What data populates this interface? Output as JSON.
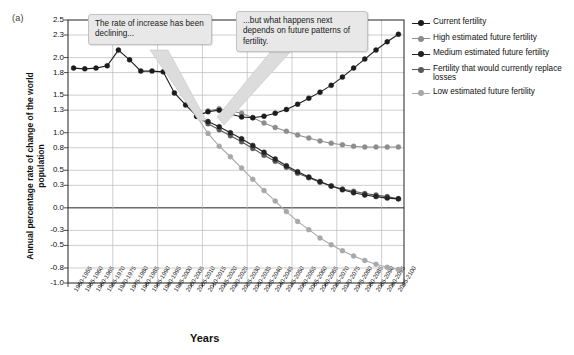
{
  "figure": {
    "panel_label": "(a)",
    "x_axis_title": "Years",
    "y_axis_title": "Annual percentage rate of change of the world population"
  },
  "callouts": [
    {
      "id": "callout-rate-decline",
      "text": "The rate of increase has been declining..."
    },
    {
      "id": "callout-future-patterns",
      "text": "...but what happens next depends on future patterns of fertility."
    }
  ],
  "legend": {
    "position": "right",
    "items": [
      {
        "label": "Current fertility",
        "color": "#1c1c1c"
      },
      {
        "label": "High estimated future fertility",
        "color": "#8d8d8d"
      },
      {
        "label": "Medium estimated future fertility",
        "color": "#232323"
      },
      {
        "label": "Fertility that would currently replace losses",
        "color": "#5a5a5a"
      },
      {
        "label": "Low estimated future fertility",
        "color": "#a8a8a8"
      }
    ]
  },
  "chart_data": {
    "type": "line",
    "title": "",
    "subtitle": "",
    "xlabel": "Years",
    "ylabel": "Annual percentage rate of change of the world population",
    "grid": true,
    "legend_position": "right",
    "ylim": [
      -1.0,
      2.5
    ],
    "ytick_labels": [
      "2.5",
      "2.3",
      "2.0",
      "1.8",
      "1.5",
      "1.3",
      "1.0",
      "0.8",
      "0.5",
      "0.3",
      "0.0",
      "-0.3",
      "-0.5",
      "-0.8",
      "-1.0"
    ],
    "ytick_values": [
      2.5,
      2.3,
      2.0,
      1.8,
      1.5,
      1.3,
      1.0,
      0.8,
      0.5,
      0.3,
      0.0,
      -0.3,
      -0.5,
      -0.8,
      -1.0
    ],
    "categories": [
      "1950-1955",
      "1955-1960",
      "1960-1965",
      "1965-1970",
      "1970-1975",
      "1975-1980",
      "1980-1985",
      "1985-1990",
      "1990-1995",
      "1995-2000",
      "2000-2005",
      "2005-2010",
      "2010-2015",
      "2015-2020",
      "2020-2025",
      "2025-2030",
      "2030-2035",
      "2035-2040",
      "2040-2045",
      "2045-2050",
      "2050-2055",
      "2055-2060",
      "2060-2065",
      "2065-2070",
      "2070-2075",
      "2075-2080",
      "2080-2085",
      "2085-2090",
      "2090-2095",
      "2095-2100"
    ],
    "projection_start_category": "2005-2010",
    "series": [
      {
        "name": "Current fertility",
        "color": "#1c1c1c",
        "values": [
          1.86,
          1.85,
          1.86,
          1.89,
          2.1,
          1.97,
          1.82,
          1.82,
          1.81,
          1.53,
          1.37,
          1.22,
          1.28,
          1.3,
          1.25,
          1.21,
          1.2,
          1.22,
          1.26,
          1.31,
          1.38,
          1.46,
          1.54,
          1.63,
          1.74,
          1.86,
          1.98,
          2.1,
          2.21,
          2.31
        ]
      },
      {
        "name": "High estimated future fertility",
        "color": "#8d8d8d",
        "values": [
          null,
          null,
          null,
          null,
          null,
          null,
          null,
          null,
          null,
          null,
          null,
          1.22,
          1.29,
          1.32,
          1.29,
          1.26,
          1.2,
          1.13,
          1.07,
          1.02,
          0.97,
          0.93,
          0.89,
          0.86,
          0.84,
          0.82,
          0.81,
          0.81,
          0.81,
          0.81
        ]
      },
      {
        "name": "Medium estimated future fertility",
        "color": "#232323",
        "values": [
          null,
          null,
          null,
          null,
          null,
          null,
          null,
          null,
          null,
          null,
          null,
          1.22,
          1.15,
          1.08,
          1.0,
          0.92,
          0.83,
          0.74,
          0.65,
          0.56,
          0.48,
          0.41,
          0.35,
          0.29,
          0.24,
          0.2,
          0.17,
          0.15,
          0.13,
          0.12
        ]
      },
      {
        "name": "Fertility that would currently replace losses",
        "color": "#5a5a5a",
        "values": [
          null,
          null,
          null,
          null,
          null,
          null,
          null,
          null,
          null,
          null,
          null,
          1.22,
          1.12,
          1.04,
          0.96,
          0.88,
          0.79,
          0.7,
          0.62,
          0.54,
          0.46,
          0.4,
          0.34,
          0.29,
          0.25,
          0.22,
          0.19,
          0.17,
          0.15,
          0.12
        ]
      },
      {
        "name": "Low estimated future fertility",
        "color": "#a8a8a8",
        "values": [
          null,
          null,
          null,
          null,
          null,
          null,
          null,
          null,
          null,
          null,
          null,
          1.22,
          0.99,
          0.82,
          0.68,
          0.53,
          0.38,
          0.23,
          0.09,
          -0.05,
          -0.18,
          -0.29,
          -0.4,
          -0.49,
          -0.57,
          -0.64,
          -0.7,
          -0.75,
          -0.79,
          -0.82
        ]
      }
    ]
  }
}
